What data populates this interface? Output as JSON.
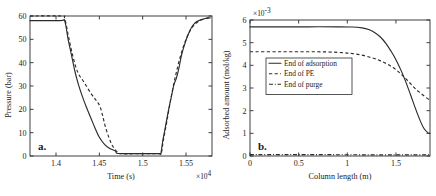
{
  "figure": {
    "panel_a_tag": "a.",
    "panel_b_tag": "b."
  },
  "chart_data": [
    {
      "id": "panel-a",
      "type": "line",
      "title": "",
      "xlabel": "Time (s)",
      "ylabel": "Pressure (bar)",
      "x_multiplier": "×10",
      "x_multiplier_exp": "4",
      "y_multiplier": "",
      "xlim": [
        13700,
        15800
      ],
      "ylim": [
        0,
        60
      ],
      "xticks": [
        14000,
        14500,
        15000,
        15500
      ],
      "xticklabels": [
        "1.4",
        "1.45",
        "1.5",
        "1.55"
      ],
      "yticks": [
        0,
        10,
        20,
        30,
        40,
        50,
        60
      ],
      "yticklabels": [
        "0",
        "10",
        "20",
        "30",
        "40",
        "50",
        "60"
      ],
      "grid": false,
      "legend": "none",
      "series": [
        {
          "name": "solid",
          "style": "solid",
          "points": [
            [
              13700,
              58.0
            ],
            [
              14050,
              58.0
            ],
            [
              14100,
              57.9
            ],
            [
              14140,
              50.0
            ],
            [
              14180,
              43.0
            ],
            [
              14220,
              36.0
            ],
            [
              14260,
              30.5
            ],
            [
              14300,
              26.0
            ],
            [
              14350,
              21.0
            ],
            [
              14400,
              16.5
            ],
            [
              14450,
              12.0
            ],
            [
              14500,
              8.0
            ],
            [
              14560,
              5.0
            ],
            [
              14620,
              3.2
            ],
            [
              14660,
              2.6
            ],
            [
              14690,
              2.0
            ],
            [
              14700,
              1.2
            ],
            [
              14760,
              1.0
            ],
            [
              15000,
              1.0
            ],
            [
              15190,
              1.0
            ],
            [
              15210,
              1.1
            ],
            [
              15230,
              6.0
            ],
            [
              15260,
              12.0
            ],
            [
              15300,
              20.0
            ],
            [
              15340,
              27.0
            ],
            [
              15360,
              30.5
            ],
            [
              15390,
              33.5
            ],
            [
              15420,
              38.0
            ],
            [
              15450,
              43.5
            ],
            [
              15490,
              48.5
            ],
            [
              15530,
              52.5
            ],
            [
              15570,
              55.5
            ],
            [
              15620,
              57.5
            ],
            [
              15680,
              58.5
            ],
            [
              15740,
              59.0
            ],
            [
              15780,
              59.2
            ]
          ]
        },
        {
          "name": "dashed",
          "style": "dashed",
          "points": [
            [
              13700,
              60.0
            ],
            [
              14060,
              60.0
            ],
            [
              14100,
              59.0
            ],
            [
              14140,
              52.0
            ],
            [
              14180,
              45.0
            ],
            [
              14230,
              38.0
            ],
            [
              14270,
              34.5
            ],
            [
              14300,
              33.0
            ],
            [
              14350,
              30.0
            ],
            [
              14400,
              27.0
            ],
            [
              14450,
              24.5
            ],
            [
              14480,
              23.0
            ],
            [
              14510,
              21.0
            ],
            [
              14540,
              17.0
            ],
            [
              14570,
              12.5
            ],
            [
              14610,
              8.0
            ],
            [
              14650,
              4.5
            ],
            [
              14700,
              2.0
            ],
            [
              14740,
              1.0
            ],
            [
              15000,
              1.0
            ],
            [
              15190,
              1.0
            ],
            [
              15215,
              1.2
            ],
            [
              15240,
              7.0
            ],
            [
              15280,
              15.0
            ],
            [
              15330,
              25.5
            ],
            [
              15380,
              34.5
            ],
            [
              15430,
              42.0
            ],
            [
              15480,
              48.0
            ],
            [
              15530,
              52.5
            ],
            [
              15590,
              56.0
            ],
            [
              15660,
              58.0
            ],
            [
              15730,
              59.0
            ],
            [
              15780,
              59.5
            ]
          ]
        }
      ]
    },
    {
      "id": "panel-b",
      "type": "line",
      "title": "",
      "xlabel": "Column length (m)",
      "ylabel": "Adsorbed amount (mol/kg)",
      "x_multiplier": "",
      "y_multiplier": "×10",
      "y_multiplier_exp": "-3",
      "xlim": [
        0,
        1.85
      ],
      "ylim": [
        0,
        6
      ],
      "xticks": [
        0,
        0.5,
        1,
        1.5
      ],
      "xticklabels": [
        "0",
        "0.5",
        "1",
        "1.5"
      ],
      "yticks": [
        0,
        1,
        2,
        3,
        4,
        5,
        6
      ],
      "yticklabels": [
        "0",
        "1",
        "2",
        "3",
        "4",
        "5",
        "6"
      ],
      "grid": false,
      "legend": "upper-left-inset",
      "legend_entries": [
        {
          "label": "End of adsorption",
          "style": "solid"
        },
        {
          "label": "End of PE",
          "style": "dashed"
        },
        {
          "label": "End of purge",
          "style": "dashdot"
        }
      ],
      "series": [
        {
          "name": "End of adsorption",
          "style": "solid",
          "points": [
            [
              0.0,
              5.7
            ],
            [
              0.3,
              5.7
            ],
            [
              0.6,
              5.7
            ],
            [
              0.9,
              5.7
            ],
            [
              1.05,
              5.69
            ],
            [
              1.15,
              5.65
            ],
            [
              1.22,
              5.58
            ],
            [
              1.28,
              5.45
            ],
            [
              1.34,
              5.25
            ],
            [
              1.4,
              4.95
            ],
            [
              1.45,
              4.62
            ],
            [
              1.5,
              4.25
            ],
            [
              1.55,
              3.8
            ],
            [
              1.6,
              3.28
            ],
            [
              1.65,
              2.7
            ],
            [
              1.7,
              2.1
            ],
            [
              1.75,
              1.55
            ],
            [
              1.79,
              1.2
            ],
            [
              1.83,
              1.02
            ],
            [
              1.85,
              1.0
            ]
          ]
        },
        {
          "name": "End of PE",
          "style": "dashed",
          "points": [
            [
              0.0,
              4.6
            ],
            [
              0.3,
              4.6
            ],
            [
              0.6,
              4.6
            ],
            [
              0.8,
              4.59
            ],
            [
              0.95,
              4.56
            ],
            [
              1.05,
              4.52
            ],
            [
              1.15,
              4.45
            ],
            [
              1.25,
              4.34
            ],
            [
              1.33,
              4.22
            ],
            [
              1.4,
              4.08
            ],
            [
              1.47,
              3.9
            ],
            [
              1.53,
              3.7
            ],
            [
              1.58,
              3.5
            ],
            [
              1.63,
              3.28
            ],
            [
              1.68,
              3.05
            ],
            [
              1.73,
              2.85
            ],
            [
              1.78,
              2.68
            ],
            [
              1.83,
              2.52
            ],
            [
              1.85,
              2.48
            ]
          ]
        },
        {
          "name": "End of purge",
          "style": "dashdot",
          "points": [
            [
              0.0,
              0.06
            ],
            [
              0.4,
              0.06
            ],
            [
              0.8,
              0.06
            ],
            [
              1.2,
              0.05
            ],
            [
              1.5,
              0.05
            ],
            [
              1.7,
              0.05
            ],
            [
              1.85,
              0.05
            ]
          ]
        }
      ]
    }
  ]
}
